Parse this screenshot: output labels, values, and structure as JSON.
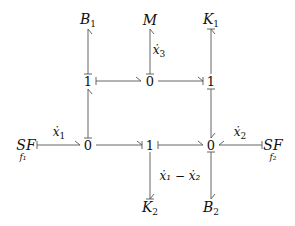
{
  "diagram": {
    "type": "bond-graph",
    "colors": {
      "stroke": "#555555",
      "text": "#111111",
      "background": "#ffffff"
    },
    "nodes": {
      "B1": {
        "main": "B",
        "sub": "1",
        "x": 88,
        "y": 20
      },
      "M": {
        "main": "M",
        "sub": "",
        "x": 150,
        "y": 20
      },
      "K1": {
        "main": "K",
        "sub": "1",
        "x": 211,
        "y": 20
      },
      "j1_top_left": {
        "main": "1",
        "x": 88,
        "y": 81
      },
      "j0_top_mid": {
        "main": "0",
        "x": 150,
        "y": 81
      },
      "j1_top_right": {
        "main": "1",
        "x": 211,
        "y": 81
      },
      "SF1": {
        "main": "SF",
        "sub": "f₁",
        "x": 27,
        "y": 145
      },
      "j0_bot_left": {
        "main": "0",
        "x": 88,
        "y": 145
      },
      "j1_bot_mid": {
        "main": "1",
        "x": 150,
        "y": 145
      },
      "j0_bot_right": {
        "main": "0",
        "x": 211,
        "y": 145
      },
      "SF2": {
        "main": "SF",
        "sub": "f₂",
        "x": 272,
        "y": 145
      },
      "K2": {
        "main": "K",
        "sub": "2",
        "x": 150,
        "y": 208
      },
      "B2": {
        "main": "B",
        "sub": "2",
        "x": 211,
        "y": 208
      }
    },
    "flow_labels": {
      "x1dot": {
        "base": "ẋ",
        "sub": "1",
        "x": 57,
        "y": 133
      },
      "x2dot": {
        "base": "ẋ",
        "sub": "2",
        "x": 240,
        "y": 133
      },
      "x3dot": {
        "base": "ẋ",
        "sub": "3",
        "x": 160,
        "y": 51
      },
      "x1_minus_x2": {
        "text": "ẋ₁ − ẋ₂",
        "x": 182,
        "y": 177
      }
    },
    "bonds": [
      {
        "from": "j1_top_left",
        "to": "B1"
      },
      {
        "from": "j0_top_mid",
        "to": "M",
        "label": "x3dot"
      },
      {
        "from": "j1_top_right",
        "to": "K1"
      },
      {
        "from": "j1_top_left",
        "to": "j0_top_mid"
      },
      {
        "from": "j0_top_mid",
        "to": "j1_top_right"
      },
      {
        "from": "j0_bot_left",
        "to": "j1_top_left"
      },
      {
        "from": "j1_top_right",
        "to": "j0_bot_right"
      },
      {
        "from": "SF1",
        "to": "j0_bot_left",
        "label": "x1dot"
      },
      {
        "from": "j0_bot_left",
        "to": "j1_bot_mid"
      },
      {
        "from": "j1_bot_mid",
        "to": "j0_bot_right"
      },
      {
        "from": "SF2",
        "to": "j0_bot_right",
        "label": "x2dot"
      },
      {
        "from": "j1_bot_mid",
        "to": "K2",
        "label": "x1_minus_x2"
      },
      {
        "from": "j0_bot_right",
        "to": "B2"
      }
    ]
  }
}
